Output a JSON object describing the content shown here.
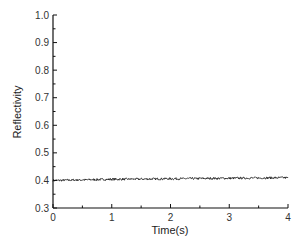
{
  "chart_data": {
    "type": "line",
    "title": "",
    "xlabel": "Time(s)",
    "ylabel": "Reflectivity",
    "xlim": [
      0,
      4
    ],
    "ylim": [
      0.3,
      1.0
    ],
    "x_ticks": [
      "0",
      "1",
      "2",
      "3",
      "4"
    ],
    "y_ticks": [
      "0.3",
      "0.4",
      "0.5",
      "0.6",
      "0.7",
      "0.8",
      "0.9",
      "1.0"
    ],
    "grid": false,
    "legend": null,
    "series": [
      {
        "name": "Reflectivity",
        "color": "#111111",
        "x": [
          0,
          0.5,
          1.0,
          1.5,
          2.0,
          2.5,
          3.0,
          3.5,
          4.0
        ],
        "values": [
          0.4,
          0.402,
          0.404,
          0.405,
          0.406,
          0.407,
          0.408,
          0.409,
          0.41
        ],
        "noise_amplitude": 0.004
      }
    ]
  },
  "labels": {
    "xlabel": "Time(s)",
    "ylabel": "Reflectivity"
  }
}
